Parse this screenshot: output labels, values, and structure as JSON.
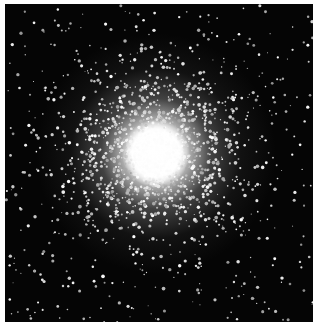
{
  "image": {
    "subject": "globular star cluster",
    "description": "Dense spherical cluster of stars with a bright white core, stars thinning out toward the edges against a black sky",
    "colors": {
      "background": "#050505",
      "core": "#ffffff",
      "stars": "#e8e8e8",
      "border": "#ffffff"
    },
    "core_center": {
      "x_pct": 49,
      "y_pct": 47
    },
    "core_radius_px": 30
  }
}
